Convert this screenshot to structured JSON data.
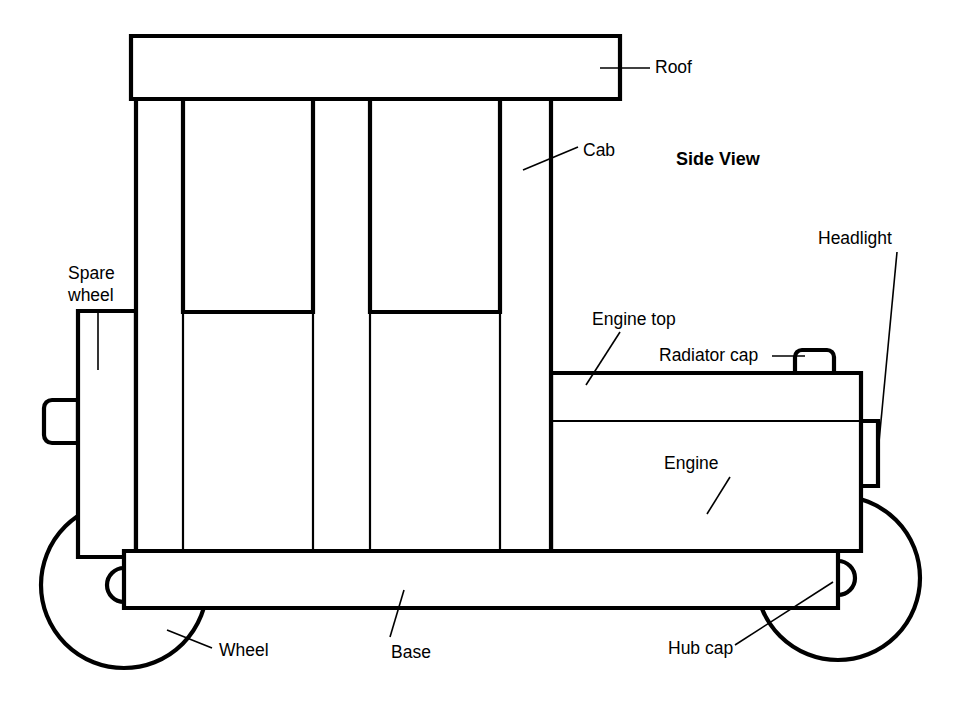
{
  "diagram": {
    "title": "Side View",
    "background_color": "#ffffff",
    "line_color": "#000000",
    "labels": [
      {
        "id": "roof",
        "text": "Roof",
        "x": 655,
        "y": 68,
        "align": "start"
      },
      {
        "id": "cab",
        "text": "Cab",
        "x": 583,
        "y": 151,
        "align": "start"
      },
      {
        "id": "side_view",
        "text": "Side View",
        "x": 676,
        "y": 160,
        "align": "start"
      },
      {
        "id": "headlight",
        "text": "Headlight",
        "x": 818,
        "y": 239,
        "align": "start"
      },
      {
        "id": "spare_wheel_1",
        "text": "Spare",
        "x": 68,
        "y": 274,
        "align": "start"
      },
      {
        "id": "spare_wheel_2",
        "text": "wheel",
        "x": 68,
        "y": 296,
        "align": "start"
      },
      {
        "id": "engine_top",
        "text": "Engine top",
        "x": 592,
        "y": 320,
        "align": "start"
      },
      {
        "id": "radiator_cap",
        "text": "Radiator cap",
        "x": 659,
        "y": 356,
        "align": "start"
      },
      {
        "id": "engine",
        "text": "Engine",
        "x": 664,
        "y": 464,
        "align": "start"
      },
      {
        "id": "wheel",
        "text": "Wheel",
        "x": 219,
        "y": 651,
        "align": "start"
      },
      {
        "id": "base",
        "text": "Base",
        "x": 391,
        "y": 653,
        "align": "start"
      },
      {
        "id": "hub_cap",
        "text": "Hub cap",
        "x": 668,
        "y": 649,
        "align": "start"
      }
    ],
    "parts": [
      "roof",
      "cab",
      "cab-window-front",
      "cab-window-rear",
      "spare-wheel",
      "spare-wheel-bracket",
      "engine",
      "engine-top",
      "radiator-cap",
      "headlight",
      "base",
      "front-wheel",
      "rear-wheel",
      "hub-cap"
    ]
  }
}
